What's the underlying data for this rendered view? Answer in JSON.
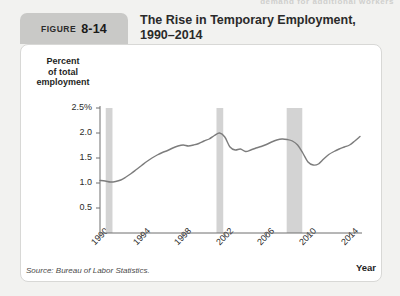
{
  "running_head": "demand for additional workers",
  "figure": {
    "badge_word": "FIGURE",
    "badge_number": "8-14",
    "title_line1": "The Rise in Temporary Employment,",
    "title_line2": "1990–2014"
  },
  "source": "Source: Bureau of Labor Statistics.",
  "colors": {
    "page_background": "#f2f2f0",
    "panel_background": "#ffffff",
    "badge_background": "#c9c9c7",
    "line": "#7c7c7c",
    "recession_band": "#d3d3d3",
    "axis": "#6e6e6e",
    "text": "#2b2b2b"
  },
  "chart_data": {
    "type": "line",
    "title": "The Rise in Temporary Employment, 1990–2014",
    "xlabel": "Year",
    "ylabel": "Percent of total employment",
    "ylabel_lines": [
      "Percent",
      "of total",
      "employment"
    ],
    "grid": false,
    "legend": "none",
    "xlim": [
      1990,
      2015
    ],
    "ylim": [
      0,
      2.5
    ],
    "ytick_values": [
      2.5,
      2.0,
      1.5,
      1.0,
      0.5
    ],
    "ytick_labels": [
      "2.5%",
      "2.0",
      "1.5",
      "1.0",
      "0.5"
    ],
    "xtick_values": [
      1990,
      1994,
      1998,
      2002,
      2006,
      2010,
      2014
    ],
    "xtick_labels": [
      "1990",
      "1994",
      "1998",
      "2002",
      "2006",
      "2010",
      "2014"
    ],
    "series": [
      {
        "name": "Temporary help services employment as percent of total employment",
        "x": [
          1990.0,
          1990.5,
          1991.0,
          1991.5,
          1992.0,
          1992.5,
          1993.0,
          1993.5,
          1994.0,
          1994.5,
          1995.0,
          1995.5,
          1996.0,
          1996.5,
          1997.0,
          1997.5,
          1998.0,
          1998.5,
          1999.0,
          1999.5,
          2000.0,
          2000.5,
          2001.0,
          2001.5,
          2002.0,
          2002.5,
          2003.0,
          2003.5,
          2004.0,
          2004.5,
          2005.0,
          2005.5,
          2006.0,
          2006.5,
          2007.0,
          2007.5,
          2008.0,
          2008.5,
          2009.0,
          2009.5,
          2010.0,
          2010.5,
          2011.0,
          2011.5,
          2012.0,
          2012.5,
          2013.0,
          2013.5,
          2014.0,
          2014.5,
          2015.0
        ],
        "y": [
          1.05,
          1.04,
          1.02,
          1.03,
          1.06,
          1.12,
          1.19,
          1.27,
          1.35,
          1.43,
          1.5,
          1.56,
          1.61,
          1.65,
          1.7,
          1.74,
          1.76,
          1.74,
          1.76,
          1.79,
          1.84,
          1.88,
          1.95,
          2.0,
          1.92,
          1.72,
          1.66,
          1.68,
          1.63,
          1.66,
          1.7,
          1.73,
          1.77,
          1.82,
          1.86,
          1.88,
          1.87,
          1.84,
          1.76,
          1.6,
          1.42,
          1.36,
          1.38,
          1.48,
          1.57,
          1.63,
          1.68,
          1.72,
          1.76,
          1.84,
          1.93
        ]
      }
    ],
    "recession_bands": [
      {
        "label": "1990–91 recession",
        "start": 1990.55,
        "end": 1991.2
      },
      {
        "label": "2001 recession",
        "start": 2001.2,
        "end": 2001.85
      },
      {
        "label": "2007–09 recession",
        "start": 2007.95,
        "end": 2009.45
      }
    ]
  }
}
